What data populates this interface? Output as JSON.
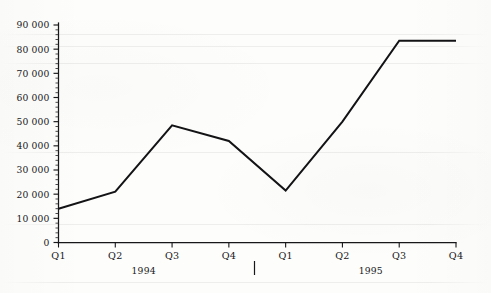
{
  "chart_data": {
    "type": "line",
    "title": "",
    "subtitle": "",
    "xlabel": "",
    "ylabel": "",
    "grid": false,
    "legend": "none",
    "ylim": [
      0,
      90000
    ],
    "ytick_step": 10000,
    "yminor_step": 2000,
    "ytick_labels": [
      "0",
      "10 000",
      "20 000",
      "30 000",
      "40 000",
      "50 000",
      "60 000",
      "70 000",
      "80 000",
      "90 000"
    ],
    "ytick_values": [
      0,
      10000,
      20000,
      30000,
      40000,
      50000,
      60000,
      70000,
      80000,
      90000
    ],
    "categories": [
      "Q1",
      "Q2",
      "Q3",
      "Q4",
      "Q1",
      "Q2",
      "Q3",
      "Q4"
    ],
    "values": [
      14000,
      21000,
      48500,
      42000,
      21500,
      50000,
      83500,
      83500
    ],
    "series": [
      {
        "name": "",
        "values": [
          14000,
          21000,
          48500,
          42000,
          21500,
          50000,
          83500,
          83500
        ]
      }
    ],
    "group_labels": [
      "1994",
      "1995"
    ],
    "group_spans": [
      [
        0,
        3
      ],
      [
        4,
        7
      ]
    ],
    "group_separator": true,
    "line_color": "#131316",
    "axis_color": "#17171a",
    "background_color": "#fdfdfb"
  }
}
